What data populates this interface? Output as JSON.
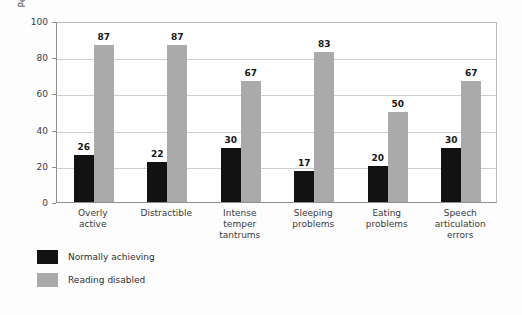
{
  "chart_data": {
    "type": "bar",
    "title": "",
    "xlabel": "",
    "ylabel": "Percent showing behavior",
    "ylim": [
      0,
      100
    ],
    "yticks": [
      0,
      20,
      40,
      60,
      80,
      100
    ],
    "grid": true,
    "legend_position": "bottom-left",
    "categories": [
      "Overly active",
      "Distractible",
      "Intense temper tantrums",
      "Sleeping problems",
      "Eating problems",
      "Speech articulation errors"
    ],
    "series": [
      {
        "name": "Normally achieving",
        "color": "#121212",
        "values": [
          26,
          22,
          30,
          17,
          20,
          30
        ]
      },
      {
        "name": "Reading disabled",
        "color": "#aaaaaa",
        "values": [
          87,
          87,
          67,
          83,
          50,
          67
        ]
      }
    ]
  }
}
